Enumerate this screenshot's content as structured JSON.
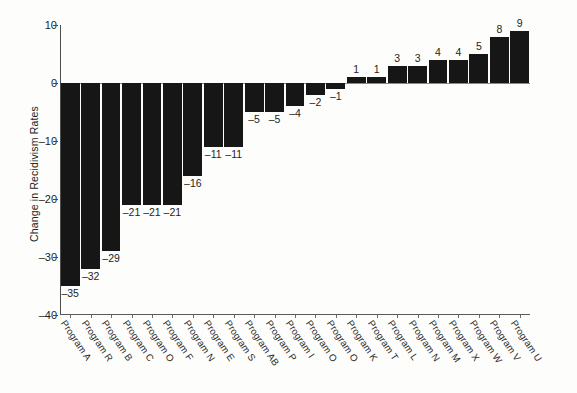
{
  "chart_data": {
    "type": "bar",
    "title": "",
    "xlabel": "",
    "ylabel": "Change in Recidivism Rates",
    "ylim": [
      -40,
      10
    ],
    "yticks": [
      10,
      0,
      -10,
      -20,
      -30,
      -40
    ],
    "ytick_labels": [
      "10",
      "0",
      "–10",
      "–20",
      "–30",
      "–40"
    ],
    "grid": false,
    "legend": null,
    "bar_color": "#161616",
    "categories": [
      "Program A",
      "Program R",
      "Program B",
      "Program C",
      "Program O",
      "Program F",
      "Program N",
      "Program E",
      "Program S",
      "Program AB",
      "Program P",
      "Program I",
      "Program O",
      "Program O",
      "Program K",
      "Program T",
      "Program L",
      "Program N",
      "Program M",
      "Program X",
      "Program W",
      "Program V",
      "Program U"
    ],
    "values": [
      -35,
      -32,
      -29,
      -21,
      -21,
      -21,
      -16,
      -11,
      -11,
      -5,
      -5,
      -4,
      -2,
      -1,
      1,
      1,
      3,
      3,
      4,
      4,
      5,
      8,
      9
    ],
    "value_labels": [
      "–35",
      "–32",
      "–29",
      "–21",
      "–21",
      "–21",
      "–16",
      "–11",
      "–11",
      "–5",
      "–5",
      "–4",
      "–2",
      "–1",
      "1",
      "1",
      "3",
      "3",
      "4",
      "4",
      "5",
      "8",
      "9"
    ]
  }
}
